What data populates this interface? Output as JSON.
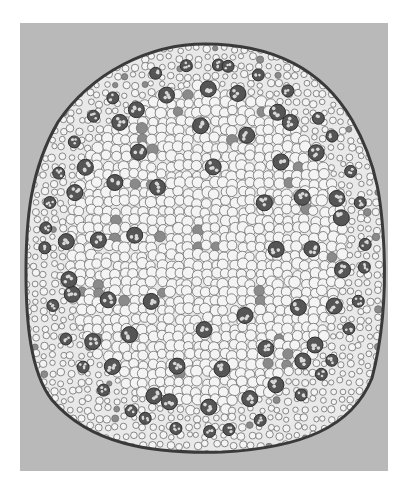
{
  "image": {
    "subject": "monocot stem cross-section micrograph",
    "style": "grayscale",
    "background_color": "#ffffff",
    "panel_color": "#b9b9b9",
    "tissue": {
      "parenchyma_fill": "#f4f4f4",
      "cell_wall": "#6e6e6e",
      "epidermis": "#3a3a3a",
      "vascular_bundle": "#555555",
      "stained_cell": "#8a8a8a"
    }
  }
}
